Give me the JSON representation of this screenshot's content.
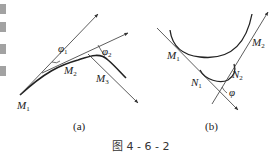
{
  "figure": {
    "caption": "图 4 - 6 - 2",
    "panel_a": {
      "label": "(a)",
      "points": [
        {
          "name": "M",
          "sub": "1"
        },
        {
          "name": "M",
          "sub": "2"
        },
        {
          "name": "M",
          "sub": "3"
        }
      ],
      "angles": [
        {
          "name": "φ",
          "sub": "1"
        },
        {
          "name": "φ",
          "sub": "2"
        }
      ]
    },
    "panel_b": {
      "label": "(b)",
      "points": [
        {
          "name": "M",
          "sub": "1"
        },
        {
          "name": "M",
          "sub": "2"
        },
        {
          "name": "N",
          "sub": "1"
        },
        {
          "name": "N",
          "sub": "2"
        }
      ],
      "angle": {
        "name": "φ"
      }
    }
  }
}
